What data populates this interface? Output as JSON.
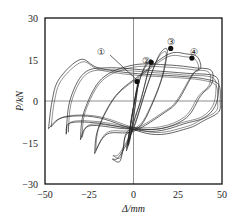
{
  "chart_data": {
    "type": "line",
    "title": "",
    "xlabel": "Δ/mm",
    "ylabel": "P/kN",
    "xlim": [
      -50,
      50
    ],
    "ylim": [
      -30,
      30
    ],
    "xticks": [
      -50,
      -25,
      0,
      25,
      50
    ],
    "yticks": [
      -30,
      -15,
      0,
      15,
      30
    ],
    "grid": false,
    "zero_lines": true,
    "legend": null,
    "series": [
      {
        "name": "cycle-1",
        "points": [
          [
            -2,
            -14
          ],
          [
            0,
            -6
          ],
          [
            2,
            3
          ],
          [
            3,
            8
          ],
          [
            2,
            5
          ],
          [
            0,
            -2
          ],
          [
            -2,
            -10
          ],
          [
            -3,
            -16
          ],
          [
            -2,
            -14
          ]
        ]
      },
      {
        "name": "cycle-2",
        "points": [
          [
            -4,
            -18
          ],
          [
            -2,
            -10
          ],
          [
            2,
            4
          ],
          [
            6,
            12
          ],
          [
            10,
            15
          ],
          [
            8,
            10
          ],
          [
            4,
            0
          ],
          [
            0,
            -8
          ],
          [
            -3,
            -16
          ],
          [
            -4,
            -18
          ]
        ]
      },
      {
        "name": "cycle-3",
        "points": [
          [
            -12,
            -21
          ],
          [
            -8,
            -20
          ],
          [
            0,
            -10
          ],
          [
            8,
            6
          ],
          [
            14,
            16
          ],
          [
            18,
            19
          ],
          [
            19,
            17
          ],
          [
            16,
            8
          ],
          [
            10,
            -2
          ],
          [
            4,
            -9
          ],
          [
            -4,
            -12
          ],
          [
            -6,
            -18
          ],
          [
            -8,
            -22
          ],
          [
            -12,
            -21
          ]
        ]
      },
      {
        "name": "cycle-4",
        "points": [
          [
            -22,
            -19
          ],
          [
            -20,
            -10
          ],
          [
            -10,
            2
          ],
          [
            5,
            10
          ],
          [
            20,
            17
          ],
          [
            30,
            17
          ],
          [
            36,
            16
          ],
          [
            38,
            12
          ],
          [
            34,
            10
          ],
          [
            25,
            0
          ],
          [
            18,
            -4
          ],
          [
            0,
            -11
          ],
          [
            -15,
            -12
          ],
          [
            -22,
            -19
          ]
        ]
      },
      {
        "name": "cycle-5",
        "points": [
          [
            -30,
            -14
          ],
          [
            -28,
            -4
          ],
          [
            -18,
            8
          ],
          [
            0,
            13
          ],
          [
            20,
            13
          ],
          [
            35,
            12
          ],
          [
            44,
            11
          ],
          [
            44,
            6
          ],
          [
            38,
            2
          ],
          [
            30,
            -6
          ],
          [
            15,
            -10
          ],
          [
            -5,
            -10
          ],
          [
            -25,
            -9
          ],
          [
            -30,
            -14
          ]
        ]
      },
      {
        "name": "cycle-6",
        "points": [
          [
            -38,
            -12
          ],
          [
            -36,
            0
          ],
          [
            -28,
            10
          ],
          [
            -15,
            12
          ],
          [
            10,
            11
          ],
          [
            30,
            10
          ],
          [
            46,
            9
          ],
          [
            48,
            4
          ],
          [
            46,
            -2
          ],
          [
            40,
            -6
          ],
          [
            30,
            -8
          ],
          [
            10,
            -11
          ],
          [
            -20,
            -8
          ],
          [
            -36,
            -8
          ],
          [
            -38,
            -12
          ]
        ]
      },
      {
        "name": "cycle-7",
        "points": [
          [
            -48,
            -10
          ],
          [
            -46,
            0
          ],
          [
            -42,
            8
          ],
          [
            -30,
            15
          ],
          [
            -20,
            12
          ],
          [
            0,
            10
          ],
          [
            25,
            9
          ],
          [
            40,
            8
          ],
          [
            48,
            6
          ],
          [
            49,
            0
          ],
          [
            48,
            -4
          ],
          [
            40,
            -7
          ],
          [
            30,
            -10
          ],
          [
            10,
            -12
          ],
          [
            -20,
            -6
          ],
          [
            -40,
            -6
          ],
          [
            -48,
            -10
          ]
        ]
      }
    ],
    "annotations": [
      {
        "label": "①",
        "x": 2,
        "y": 7,
        "desc": "marked point 1"
      },
      {
        "label": "②",
        "x": 10,
        "y": 14,
        "desc": "marked point 2"
      },
      {
        "label": "③",
        "x": 21,
        "y": 19,
        "desc": "marked point 3 (peak load)"
      },
      {
        "label": "④",
        "x": 33,
        "y": 15.5,
        "desc": "marked point 4"
      }
    ]
  },
  "labels": {
    "xlabel": "Δ/mm",
    "ylabel": "P/kN",
    "xticks": [
      "−50",
      "−25",
      "0",
      "25",
      "50"
    ],
    "yticks": [
      "30",
      "15",
      "0",
      "−15",
      "−30"
    ],
    "ann1": "①",
    "ann2": "②",
    "ann3": "③",
    "ann4": "④"
  }
}
